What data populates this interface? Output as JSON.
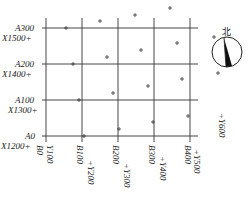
{
  "diagram": {
    "title": "",
    "a_labels": [
      "A300",
      "A200",
      "A100",
      "A0"
    ],
    "x_labels": [
      "X1500",
      "X1400",
      "X1300",
      "X1200"
    ],
    "b_labels": [
      "B0",
      "B100",
      "B200",
      "B300",
      "B400"
    ],
    "y_labels": [
      "Y100",
      "Y200",
      "Y300",
      "Y400",
      "Y500",
      "Y600"
    ],
    "north_label": "北",
    "compass_icon": "north-arrow-compass",
    "grid": {
      "a_values": [
        300,
        200,
        100,
        0
      ],
      "b_values": [
        0,
        100,
        200,
        300,
        400
      ]
    },
    "colors": {
      "line": "#333333",
      "background": "#ffffff"
    }
  }
}
